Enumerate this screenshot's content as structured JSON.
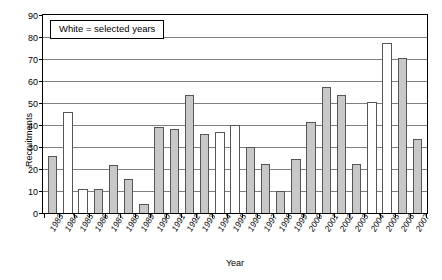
{
  "chart_data": {
    "type": "bar",
    "title": "",
    "xlabel": "Year",
    "ylabel": "Recruitments",
    "ylim": [
      0,
      90
    ],
    "ytick_step": 10,
    "yticks": [
      90,
      80,
      70,
      60,
      50,
      40,
      30,
      20,
      10,
      0
    ],
    "grid": true,
    "legend_position": "top-left-inside",
    "categories": [
      "1983",
      "1984",
      "1985",
      "1986",
      "1987",
      "1988",
      "1989",
      "1990",
      "1991",
      "1992",
      "1993",
      "1994",
      "1995",
      "1996",
      "1997",
      "1998",
      "1999",
      "2000",
      "2001",
      "2002",
      "2003",
      "2004",
      "2005",
      "2006",
      "2007"
    ],
    "values": [
      26,
      46,
      11,
      11,
      22,
      15.5,
      4,
      39,
      38,
      53.5,
      36,
      37,
      40,
      30,
      22.5,
      10,
      24.5,
      41.5,
      57.5,
      53.5,
      22.5,
      50.5,
      77.5,
      70.5,
      33.5
    ],
    "bar_fill": [
      "gray",
      "white",
      "white",
      "gray",
      "gray",
      "gray",
      "gray",
      "gray",
      "gray",
      "gray",
      "gray",
      "white",
      "white",
      "gray",
      "gray",
      "gray",
      "gray",
      "gray",
      "gray",
      "gray",
      "gray",
      "white",
      "white",
      "gray",
      "gray"
    ],
    "selected_years": [
      "1984",
      "1985",
      "1994",
      "1995",
      "2004",
      "2005"
    ],
    "colors": {
      "gray_bar": "#c8c8c8",
      "white_bar": "#ffffff",
      "bar_border": "#555555",
      "gridline": "#808080",
      "axis": "#000000"
    }
  },
  "legend": {
    "text": "White = selected years"
  }
}
